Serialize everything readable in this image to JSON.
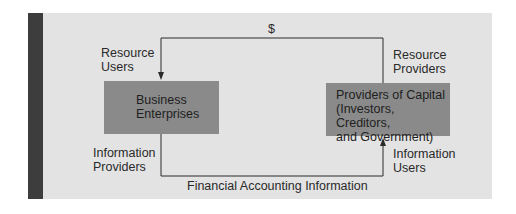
{
  "diagram": {
    "top_flow_label": "$",
    "bottom_flow_label": "Financial Accounting Information",
    "left_entity": {
      "name_line1": "Business",
      "name_line2": "Enterprises",
      "top_label_line1": "Resource",
      "top_label_line2": "Users",
      "bottom_label_line1": "Information",
      "bottom_label_line2": "Providers"
    },
    "right_entity": {
      "name_line1": "Providers of Capital",
      "name_line2": "(Investors, Creditors,",
      "name_line3": "and Government)",
      "top_label_line1": "Resource",
      "top_label_line2": "Providers",
      "bottom_label_line1": "Information",
      "bottom_label_line2": "Users"
    },
    "colors": {
      "panel": "#e3e3e3",
      "side_bar": "#3d3d3d",
      "box": "#8a8a8a",
      "line": "#2a2a2a"
    }
  }
}
